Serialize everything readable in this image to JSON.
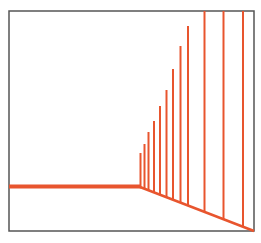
{
  "diagram": {
    "colors": {
      "background": "#ffffff",
      "frame": "#555555",
      "line": "#e8552e"
    },
    "frame": {
      "x": 9,
      "y": 11,
      "width": 245,
      "height": 220
    },
    "horizontal_line": {
      "x1": 9,
      "x2": 140,
      "y": 186.5,
      "thickness": 4
    },
    "diagonal_line": {
      "x1": 140,
      "y1": 187,
      "x2": 254,
      "y2": 231,
      "thickness": 2.5
    },
    "vertical_lines": [
      {
        "x": 140.5,
        "top": 153
      },
      {
        "x": 144.5,
        "top": 144
      },
      {
        "x": 148.5,
        "top": 132
      },
      {
        "x": 154,
        "top": 121
      },
      {
        "x": 160,
        "top": 106
      },
      {
        "x": 166.5,
        "top": 90
      },
      {
        "x": 173,
        "top": 69
      },
      {
        "x": 180.5,
        "top": 46
      },
      {
        "x": 188,
        "top": 26
      },
      {
        "x": 204.5,
        "top": 11
      },
      {
        "x": 223.5,
        "top": 11
      },
      {
        "x": 243,
        "top": 11
      }
    ]
  }
}
